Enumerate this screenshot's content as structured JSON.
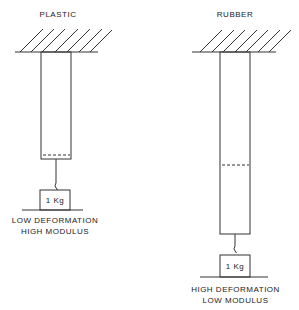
{
  "plastic": {
    "title": "PLASTIC",
    "weight": "1 Kg",
    "caption_line1": "LOW  DEFORMATION",
    "caption_line2": "HIGH  MODULUS"
  },
  "rubber": {
    "title": "RUBBER",
    "weight": "1 Kg",
    "caption_line1": "HIGH  DEFORMATION",
    "caption_line2": "LOW  MODULUS"
  }
}
